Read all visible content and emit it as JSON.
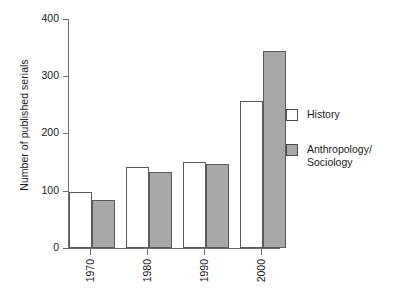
{
  "chart_data": {
    "type": "bar",
    "title": "",
    "subtitle": "",
    "xlabel": "",
    "ylabel": "Number of published serials",
    "categories": [
      "1970",
      "1980",
      "1990",
      "2000"
    ],
    "series": [
      {
        "name": "History",
        "color": "#ffffff",
        "values": [
          98,
          141,
          150,
          257
        ]
      },
      {
        "name": "Anthropology/\nSociology",
        "color": "#a8a8a8",
        "values": [
          84,
          132,
          147,
          344
        ]
      }
    ],
    "ylim": [
      0,
      400
    ],
    "yticks": [
      0,
      100,
      200,
      300,
      400
    ],
    "ytick_labels": [
      "0",
      "100",
      "200",
      "300",
      "400"
    ],
    "grid": false,
    "legend_position": "right",
    "xtick_rotation": 90
  },
  "axis": {
    "y_title": "Number of published serials",
    "ticks": [
      {
        "value": 400,
        "label": "400"
      },
      {
        "value": 300,
        "label": "300"
      },
      {
        "value": 200,
        "label": "200"
      },
      {
        "value": 100,
        "label": "100"
      },
      {
        "value": 0,
        "label": "0"
      }
    ],
    "x_labels": [
      "1970",
      "1980",
      "1990",
      "2000"
    ]
  },
  "legend": {
    "items": [
      {
        "label": "History",
        "swatch": "white-swatch-icon"
      },
      {
        "label": "Anthropology/\nSociology",
        "swatch": "gray-swatch-icon"
      }
    ]
  }
}
